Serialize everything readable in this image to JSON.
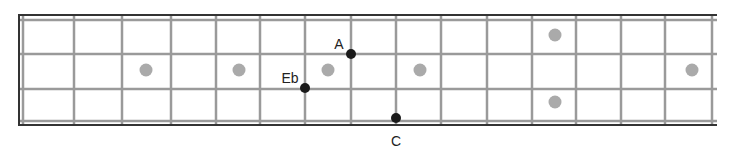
{
  "diagram": {
    "type": "guitar-fretboard",
    "strings_shown": 4,
    "colors": {
      "border": "#333333",
      "fret_line": "#9a9a9a",
      "string_line": "#9a9a9a",
      "inlay_marker": "#aaaaaa",
      "note_dot": "#1a1a1a",
      "label": "#222222"
    },
    "frets_x": [
      74,
      122,
      171,
      216,
      260,
      305,
      351,
      396,
      441,
      487,
      532,
      576,
      621,
      665,
      712
    ],
    "nut": {
      "outer_x": 19,
      "inner_x": 23
    },
    "border": {
      "top_y": 15,
      "bottom_y": 125,
      "right_x": 717
    },
    "strings_y": [
      20,
      54,
      89,
      121
    ],
    "inlay_markers": [
      {
        "x": 146,
        "y": 70
      },
      {
        "x": 239,
        "y": 70
      },
      {
        "x": 328,
        "y": 70
      },
      {
        "x": 420,
        "y": 70
      },
      {
        "x": 555,
        "y": 35
      },
      {
        "x": 555,
        "y": 102
      },
      {
        "x": 692,
        "y": 70
      }
    ],
    "notes": [
      {
        "name": "A",
        "x": 351,
        "y": 54,
        "label_x": 339,
        "label_y": 49
      },
      {
        "name": "Eb",
        "x": 305,
        "y": 88,
        "label_x": 290,
        "label_y": 83
      },
      {
        "name": "C",
        "x": 396,
        "y": 118,
        "label_x": 396,
        "label_y": 146
      }
    ]
  }
}
